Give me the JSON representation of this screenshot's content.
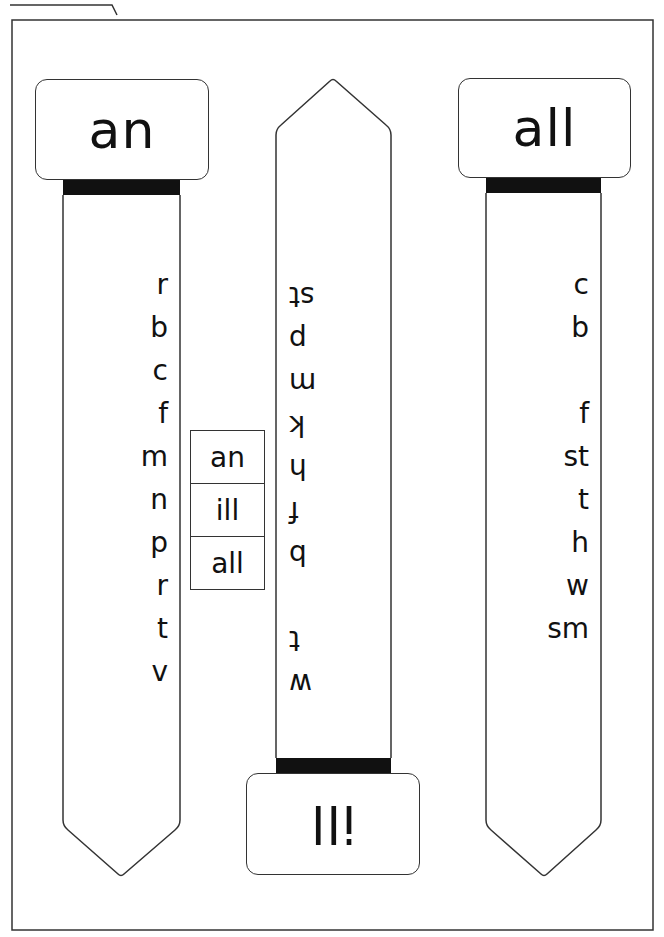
{
  "worksheet": {
    "left_strip": {
      "header": "an",
      "letters": [
        "r",
        "b",
        "c",
        "f",
        "m",
        "n",
        "p",
        "r",
        "t",
        "v"
      ]
    },
    "middle_strip": {
      "header": "ill",
      "header_flipped": true,
      "letters_flipped": true,
      "letters_top_to_bottom_as_rendered": [
        "st",
        "p",
        "m",
        "k",
        "h",
        "f",
        "b",
        "",
        "t",
        "w"
      ]
    },
    "right_strip": {
      "header": "all",
      "letters": [
        "c",
        "b",
        "",
        "f",
        "st",
        "t",
        "h",
        "w",
        "sm"
      ]
    },
    "word_box": {
      "words": [
        "an",
        "ill",
        "all"
      ]
    }
  },
  "colors": {
    "outline": "#333333",
    "band": "#111111",
    "background": "#ffffff"
  }
}
